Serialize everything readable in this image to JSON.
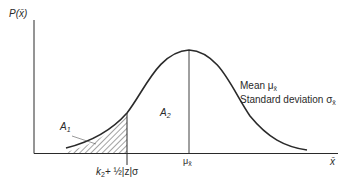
{
  "diagram": {
    "y_axis_label": "P(x̄)",
    "x_axis_label": "x̄",
    "mean_tick_label": "μ",
    "mean_tick_sub": "x̄",
    "threshold_label_k": "k",
    "threshold_label_k_sub": "2",
    "threshold_label_rest": "+ ½|z|σ",
    "area1_label": "A",
    "area1_sub": "1",
    "area2_label": "A",
    "area2_sub": "2",
    "legend_mean_text": "Mean μ",
    "legend_mean_sub": "x̄",
    "legend_sd_text": "Standard deviation σ",
    "legend_sd_sub": "x̄",
    "colors": {
      "line": "#2a2a2a",
      "hatch": "#333333",
      "background": "#ffffff"
    }
  }
}
